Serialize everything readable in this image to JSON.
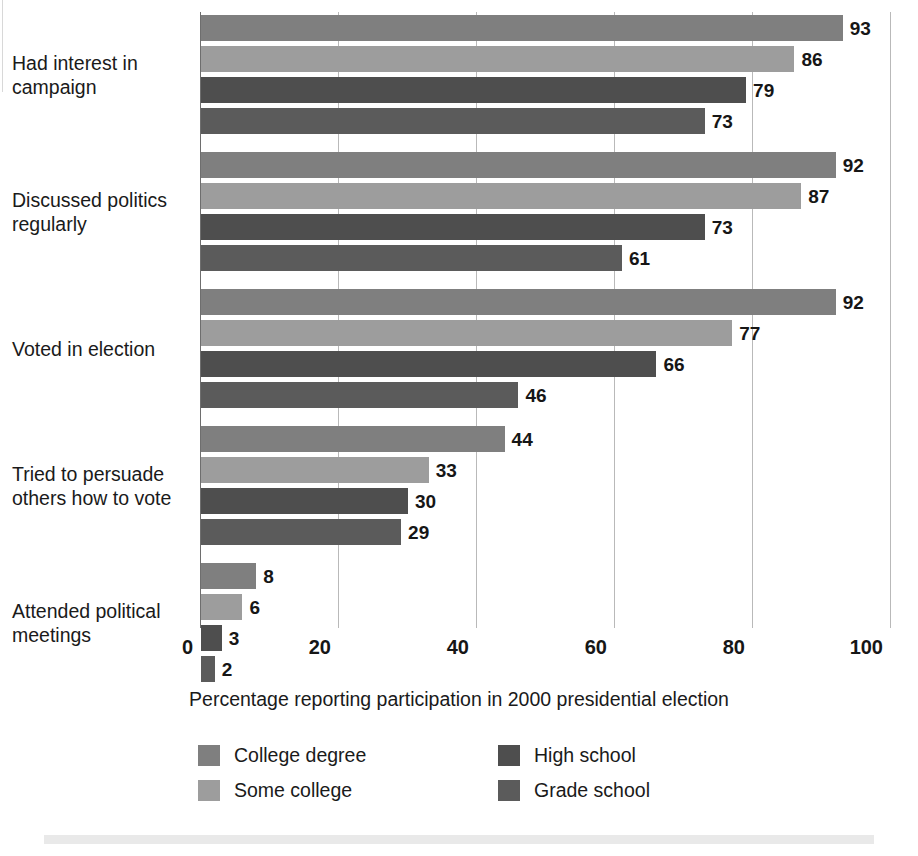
{
  "chart_data": {
    "type": "bar",
    "orientation": "horizontal",
    "title": "",
    "xlabel": "Percentage reporting participation in 2000 presidential election",
    "ylabel": "",
    "xlim": [
      0,
      100
    ],
    "xticks": [
      0,
      20,
      40,
      60,
      80,
      100
    ],
    "xtick_labels": [
      "0",
      "20",
      "40",
      "60",
      "80",
      "100"
    ],
    "grid": true,
    "grid_axis": "x",
    "legend_position": "bottom",
    "data_labels": true,
    "categories": [
      "Had interest in\ncampaign",
      "Discussed politics\nregularly",
      "Voted in election",
      "Tried to persuade\nothers how to vote",
      "Attended political\nmeetings"
    ],
    "series": [
      {
        "name": "College degree",
        "color": "#7f7f7f",
        "values": [
          93,
          92,
          92,
          44,
          8
        ]
      },
      {
        "name": "Some college",
        "color": "#9d9d9d",
        "values": [
          86,
          87,
          77,
          33,
          6
        ]
      },
      {
        "name": "High school",
        "color": "#4e4e4e",
        "values": [
          79,
          73,
          66,
          30,
          3
        ]
      },
      {
        "name": "Grade school",
        "color": "#5b5b5b",
        "values": [
          73,
          61,
          46,
          29,
          2
        ]
      }
    ]
  },
  "axis_caption": "Percentage reporting participation in 2000 presidential election",
  "legend": {
    "entries": [
      {
        "label": "College degree",
        "swatch": "s0"
      },
      {
        "label": "High school",
        "swatch": "s2"
      },
      {
        "label": "Some college",
        "swatch": "s1"
      },
      {
        "label": "Grade school",
        "swatch": "s3"
      }
    ]
  }
}
